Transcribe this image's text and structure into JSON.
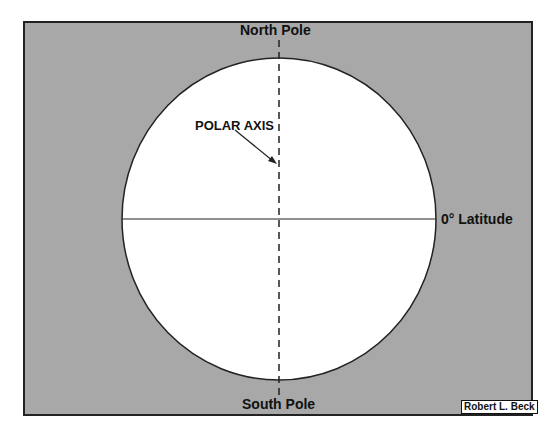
{
  "diagram": {
    "labels": {
      "north": "North Pole",
      "south": "South Pole",
      "axis": "POLAR AXIS",
      "equator": "0° Latitude"
    },
    "credit": "Robert L. Beck",
    "colors": {
      "background": "#a8a8a8",
      "globe": "#ffffff",
      "lines": "#222222"
    }
  }
}
